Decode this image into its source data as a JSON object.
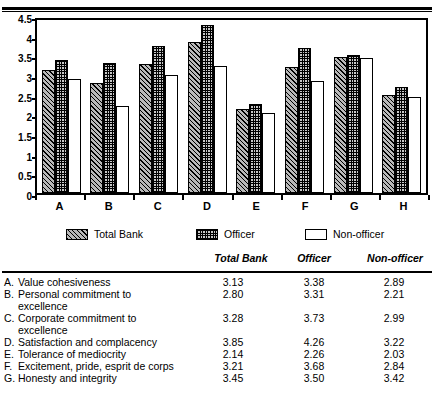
{
  "chart_data": {
    "type": "bar",
    "title": "",
    "xlabel": "",
    "ylabel": "",
    "ylim": [
      0,
      4.5
    ],
    "yticks": [
      "0",
      "0.5",
      "1",
      "1.5",
      "2",
      "2.5",
      "3",
      "3.5",
      "4",
      "4.5"
    ],
    "ytick_values": [
      0,
      0.5,
      1,
      1.5,
      2,
      2.5,
      3,
      3.5,
      4,
      4.5
    ],
    "grid": false,
    "legend_position": "below-axes",
    "categories": [
      "A",
      "B",
      "C",
      "D",
      "E",
      "F",
      "G",
      "H"
    ],
    "series": [
      {
        "name": "Total Bank",
        "values": [
          3.13,
          2.8,
          3.28,
          3.85,
          2.14,
          3.21,
          3.45,
          2.49
        ]
      },
      {
        "name": "Officer",
        "values": [
          3.38,
          3.31,
          3.73,
          4.26,
          2.26,
          3.68,
          3.5,
          2.7
        ]
      },
      {
        "name": "Non-officer",
        "values": [
          2.89,
          2.21,
          2.99,
          3.22,
          2.03,
          2.84,
          3.42,
          2.43
        ]
      }
    ]
  },
  "legend": {
    "items": [
      {
        "label": "Total Bank",
        "pattern": "diagonal-hatch"
      },
      {
        "label": "Officer",
        "pattern": "checker-stipple"
      },
      {
        "label": "Non-officer",
        "pattern": "empty-white"
      }
    ]
  },
  "table": {
    "headers": [
      "Total Bank",
      "Officer",
      "Non-officer"
    ],
    "rows": [
      {
        "letter": "A.",
        "label": "Value cohesiveness",
        "label2": "",
        "v0": "3.13",
        "v1": "3.38",
        "v2": "2.89"
      },
      {
        "letter": "B.",
        "label": "Personal commitment to",
        "label2": "excellence",
        "v0": "2.80",
        "v1": "3.31",
        "v2": "2.21"
      },
      {
        "letter": "C.",
        "label": "Corporate commitment to",
        "label2": "excellence",
        "v0": "3.28",
        "v1": "3.73",
        "v2": "2.99"
      },
      {
        "letter": "D.",
        "label": "Satisfaction and complacency",
        "label2": "",
        "v0": "3.85",
        "v1": "4.26",
        "v2": "3.22"
      },
      {
        "letter": "E.",
        "label": "Tolerance of mediocrity",
        "label2": "",
        "v0": "2.14",
        "v1": "2.26",
        "v2": "2.03"
      },
      {
        "letter": "F.",
        "label": "Excitement, pride, esprit de corps",
        "label2": "",
        "v0": "3.21",
        "v1": "3.68",
        "v2": "2.84"
      },
      {
        "letter": "G.",
        "label": "Honesty and integrity",
        "label2": "",
        "v0": "3.45",
        "v1": "3.50",
        "v2": "3.42"
      }
    ]
  }
}
